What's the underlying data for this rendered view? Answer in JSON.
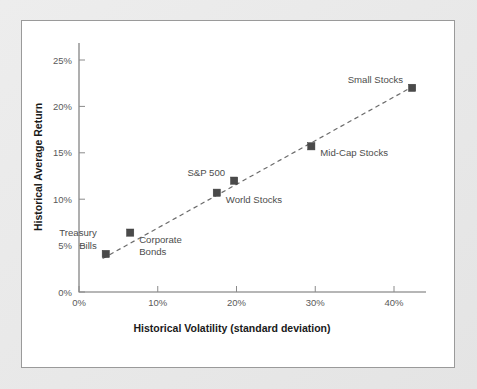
{
  "chart_data": {
    "type": "scatter",
    "title": "",
    "xlabel": "Historical Volatility (standard deviation)",
    "ylabel": "Historical Average Return",
    "xlim": [
      0,
      45
    ],
    "ylim": [
      0,
      26.5
    ],
    "grid": false,
    "legend": "none",
    "xtick_labels": [
      "0%",
      "10%",
      "20%",
      "30%",
      "40%"
    ],
    "xtick_values": [
      0,
      10,
      20,
      30,
      40
    ],
    "ytick_labels": [
      "0%",
      "5%",
      "10%",
      "15%",
      "20%",
      "25%"
    ],
    "ytick_values": [
      0,
      5,
      10,
      15,
      20,
      25
    ],
    "points": [
      {
        "label": "Treasury Bills",
        "x": 3.4,
        "y": 4.1,
        "label_lines": [
          "Treasury",
          "Bills"
        ],
        "label_pos": "above-left"
      },
      {
        "label": "Corporate Bonds",
        "x": 6.5,
        "y": 6.4,
        "label_lines": [
          "Corporate",
          "Bonds"
        ],
        "label_pos": "below-right"
      },
      {
        "label": "World Stocks",
        "x": 17.5,
        "y": 10.7,
        "label_lines": [
          "World Stocks"
        ],
        "label_pos": "below-right"
      },
      {
        "label": "S&P 500",
        "x": 19.7,
        "y": 12.0,
        "label_lines": [
          "S&P 500"
        ],
        "label_pos": "above-left"
      },
      {
        "label": "Mid-Cap Stocks",
        "x": 29.5,
        "y": 15.7,
        "label_lines": [
          "Mid-Cap Stocks"
        ],
        "label_pos": "below-right"
      },
      {
        "label": "Small Stocks",
        "x": 42.3,
        "y": 22.0,
        "label_lines": [
          "Small Stocks"
        ],
        "label_pos": "above-left"
      }
    ],
    "trendline": {
      "x0": 3.0,
      "y0": 3.6,
      "x1": 42.3,
      "y1": 22.1,
      "style": "dashed"
    }
  },
  "axes": {
    "x_title": "Historical Volatility (standard deviation)",
    "y_title": "Historical Average Return"
  }
}
